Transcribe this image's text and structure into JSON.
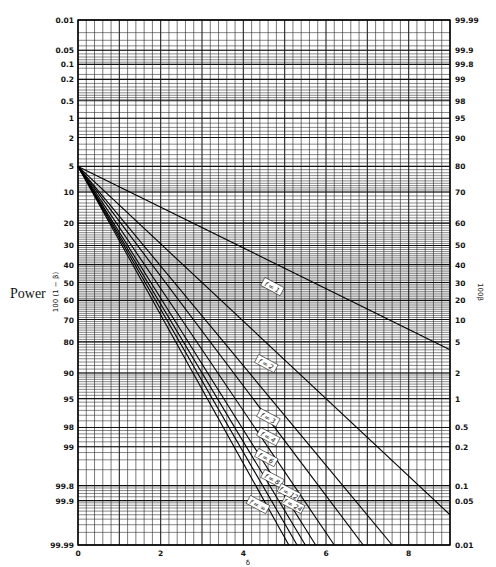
{
  "side_label": "Power",
  "chart_data": {
    "type": "line",
    "title": "",
    "xlabel": "δ",
    "ylabel_left": "100 (1 − β)",
    "ylabel_right": "100β",
    "xlim": [
      0,
      9
    ],
    "x_ticks": [
      0,
      2,
      4,
      6,
      8
    ],
    "y_scale": "normal-probability",
    "left_ticks": [
      "0.01",
      "0.05",
      "0.1",
      "0.2",
      "0.5",
      "1",
      "2",
      "5",
      "10",
      "20",
      "30",
      "40",
      "50",
      "60",
      "70",
      "80",
      "90",
      "95",
      "98",
      "99",
      "99.8",
      "99.9",
      "99.99"
    ],
    "right_ticks": [
      "99.99",
      "99.9",
      "99.8",
      "99",
      "98",
      "95",
      "90",
      "80",
      "70",
      "60",
      "50",
      "40",
      "30",
      "20",
      "10",
      "5",
      "2",
      "1",
      "0.5",
      "0.2",
      "0.1",
      "0.05",
      "0.01"
    ],
    "grid": true,
    "series": [
      {
        "name": "f = 1",
        "x": [
          0,
          9
        ],
        "left_pct": [
          5,
          83
        ]
      },
      {
        "name": "f = 2",
        "x": [
          0,
          9
        ],
        "left_pct": [
          5,
          99.95
        ]
      },
      {
        "name": "f = 3",
        "x": [
          0,
          7.6
        ],
        "left_pct": [
          5,
          99.99
        ]
      },
      {
        "name": "f = 4",
        "x": [
          0,
          6.9
        ],
        "left_pct": [
          5,
          99.99
        ]
      },
      {
        "name": "f = 6",
        "x": [
          0,
          6.2
        ],
        "left_pct": [
          5,
          99.99
        ]
      },
      {
        "name": "f = 8",
        "x": [
          0,
          5.75
        ],
        "left_pct": [
          5,
          99.99
        ]
      },
      {
        "name": "f = 12",
        "x": [
          0,
          5.5
        ],
        "left_pct": [
          5,
          99.99
        ]
      },
      {
        "name": "f = 24",
        "x": [
          0,
          5.3
        ],
        "left_pct": [
          5,
          99.99
        ]
      },
      {
        "name": "f = ∞",
        "x": [
          0,
          5.1
        ],
        "left_pct": [
          5,
          99.99
        ]
      }
    ],
    "label_positions": [
      {
        "name": "f = 1",
        "x": 4.7,
        "y": 287
      },
      {
        "name": "f = 2",
        "x": 4.55,
        "y": 364
      },
      {
        "name": "f = 3",
        "x": 4.6,
        "y": 418
      },
      {
        "name": "f = 4",
        "x": 4.6,
        "y": 437
      },
      {
        "name": "f = 6",
        "x": 4.55,
        "y": 458
      },
      {
        "name": "f = 8",
        "x": 4.7,
        "y": 479
      },
      {
        "name": "f = 12",
        "x": 5.1,
        "y": 493
      },
      {
        "name": "f = 24",
        "x": 5.2,
        "y": 505
      },
      {
        "name": "f = ∞",
        "x": 4.35,
        "y": 505
      }
    ]
  }
}
